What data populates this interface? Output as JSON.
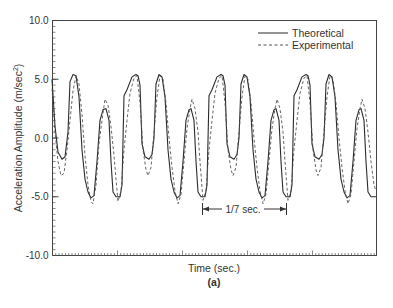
{
  "figure": {
    "panel_label": "(a)"
  },
  "chart_data": {
    "type": "line",
    "title": "",
    "xlabel": "Time (sec.)",
    "ylabel": "Acceleration Amplitude (m/sec²)",
    "ylabel_parts": {
      "main": "Acceleration Amplitude (m/sec",
      "sup": "2",
      "close": ")"
    },
    "ylim": [
      -10.0,
      10.0
    ],
    "yticks": [
      10.0,
      5.0,
      0.0,
      -5.0,
      -10.0
    ],
    "ytick_labels": [
      "10.0",
      "5.0",
      "0.0",
      "-5.0",
      "-10.0"
    ],
    "xticks_labeled": false,
    "grid": false,
    "legend_position": "upper right",
    "legend": [
      {
        "name": "Theoretical",
        "style": "solid"
      },
      {
        "name": "Experimental",
        "style": "dashed"
      }
    ],
    "annotations": [
      {
        "text": "1/7 sec.",
        "type": "period-bracket",
        "note": "span of one repeating period"
      }
    ],
    "x_units": "pixel-relative time (period = 1/7 sec ≈ 85 units)",
    "series": [
      {
        "name": "Theoretical",
        "style": "solid",
        "points": [
          [
            52,
            5.0
          ],
          [
            55,
            1.0
          ],
          [
            58,
            -1.2
          ],
          [
            62,
            -1.8
          ],
          [
            65,
            -1.6
          ],
          [
            68,
            0.5
          ],
          [
            70,
            4.8
          ],
          [
            73,
            5.4
          ],
          [
            76,
            5.3
          ],
          [
            79,
            3.5
          ],
          [
            82,
            -1.0
          ],
          [
            85,
            -3.5
          ],
          [
            88,
            -4.6
          ],
          [
            91,
            -5.1
          ],
          [
            94,
            -4.9
          ],
          [
            97,
            -2.0
          ],
          [
            100,
            1.5
          ],
          [
            103,
            2.4
          ],
          [
            106,
            2.5
          ],
          [
            109,
            1.5
          ],
          [
            111,
            -2.0
          ],
          [
            113,
            -4.6
          ],
          [
            116,
            -5.0
          ],
          [
            120,
            -5.0
          ],
          [
            122,
            -4.0
          ],
          [
            124,
            3.6
          ],
          [
            127,
            4.1
          ],
          [
            132,
            5.2
          ],
          [
            136,
            5.4
          ],
          [
            138,
            5.3
          ],
          [
            140,
            4.5
          ],
          [
            142,
            -0.5
          ],
          [
            145,
            -1.6
          ],
          [
            149,
            -1.8
          ],
          [
            152,
            -1.4
          ],
          [
            154,
            0.0
          ],
          [
            156,
            4.6
          ],
          [
            159,
            5.4
          ],
          [
            162,
            5.2
          ],
          [
            165,
            3.5
          ],
          [
            168,
            -1.0
          ],
          [
            171,
            -3.5
          ],
          [
            174,
            -4.6
          ],
          [
            177,
            -5.1
          ],
          [
            180,
            -4.9
          ],
          [
            183,
            -2.0
          ],
          [
            186,
            1.5
          ],
          [
            189,
            2.4
          ],
          [
            191,
            2.5
          ],
          [
            194,
            1.5
          ],
          [
            196,
            -2.0
          ],
          [
            198,
            -4.6
          ],
          [
            201,
            -5.0
          ],
          [
            205,
            -5.0
          ],
          [
            207,
            -4.0
          ],
          [
            209,
            3.6
          ],
          [
            212,
            4.1
          ],
          [
            217,
            5.2
          ],
          [
            221,
            5.4
          ],
          [
            223,
            5.3
          ],
          [
            225,
            4.5
          ],
          [
            227,
            -0.5
          ],
          [
            230,
            -1.6
          ],
          [
            234,
            -1.8
          ],
          [
            237,
            -1.4
          ],
          [
            239,
            0.0
          ],
          [
            241,
            4.6
          ],
          [
            244,
            5.4
          ],
          [
            247,
            5.2
          ],
          [
            250,
            3.5
          ],
          [
            253,
            -1.0
          ],
          [
            256,
            -3.5
          ],
          [
            259,
            -4.6
          ],
          [
            262,
            -5.1
          ],
          [
            265,
            -4.9
          ],
          [
            268,
            -2.0
          ],
          [
            271,
            1.5
          ],
          [
            274,
            2.4
          ],
          [
            276,
            2.5
          ],
          [
            279,
            1.5
          ],
          [
            281,
            -2.0
          ],
          [
            283,
            -4.6
          ],
          [
            286,
            -5.0
          ],
          [
            290,
            -5.0
          ],
          [
            292,
            -4.0
          ],
          [
            294,
            3.6
          ],
          [
            297,
            4.1
          ],
          [
            302,
            5.2
          ],
          [
            306,
            5.4
          ],
          [
            308,
            5.3
          ],
          [
            310,
            4.5
          ],
          [
            312,
            -0.5
          ],
          [
            315,
            -1.6
          ],
          [
            319,
            -1.8
          ],
          [
            322,
            -1.4
          ],
          [
            324,
            0.0
          ],
          [
            326,
            4.6
          ],
          [
            329,
            5.4
          ],
          [
            332,
            5.2
          ],
          [
            335,
            3.5
          ],
          [
            338,
            -1.0
          ],
          [
            341,
            -3.5
          ],
          [
            344,
            -4.6
          ],
          [
            347,
            -5.1
          ],
          [
            350,
            -4.9
          ],
          [
            353,
            -2.0
          ],
          [
            356,
            1.5
          ],
          [
            359,
            2.4
          ],
          [
            361,
            2.5
          ],
          [
            364,
            1.5
          ],
          [
            366,
            -2.0
          ],
          [
            368,
            -4.6
          ],
          [
            371,
            -5.0
          ],
          [
            376,
            -5.0
          ]
        ]
      },
      {
        "name": "Experimental",
        "style": "dashed",
        "points": [
          [
            52,
            4.2
          ],
          [
            55,
            0.5
          ],
          [
            58,
            -2.0
          ],
          [
            61,
            -3.2
          ],
          [
            64,
            -3.0
          ],
          [
            67,
            -1.0
          ],
          [
            70,
            1.5
          ],
          [
            73,
            4.0
          ],
          [
            76,
            5.3
          ],
          [
            79,
            4.6
          ],
          [
            82,
            2.0
          ],
          [
            85,
            -1.5
          ],
          [
            88,
            -4.0
          ],
          [
            91,
            -5.4
          ],
          [
            93,
            -5.6
          ],
          [
            96,
            -4.0
          ],
          [
            99,
            -0.5
          ],
          [
            102,
            1.5
          ],
          [
            105,
            3.3
          ],
          [
            108,
            2.8
          ],
          [
            111,
            1.0
          ],
          [
            114,
            -1.5
          ],
          [
            116,
            -3.5
          ],
          [
            118,
            -5.4
          ],
          [
            121,
            -4.5
          ],
          [
            124,
            -1.0
          ],
          [
            127,
            1.5
          ],
          [
            130,
            3.8
          ],
          [
            134,
            5.1
          ],
          [
            137,
            5.3
          ],
          [
            140,
            3.0
          ],
          [
            143,
            -1.0
          ],
          [
            146,
            -2.7
          ],
          [
            148,
            -3.2
          ],
          [
            151,
            -2.5
          ],
          [
            154,
            0.5
          ],
          [
            157,
            3.5
          ],
          [
            160,
            5.3
          ],
          [
            163,
            5.0
          ],
          [
            166,
            3.0
          ],
          [
            169,
            0.0
          ],
          [
            172,
            -2.5
          ],
          [
            175,
            -4.5
          ],
          [
            178,
            -5.6
          ],
          [
            181,
            -4.8
          ],
          [
            184,
            -2.0
          ],
          [
            187,
            0.8
          ],
          [
            190,
            2.5
          ],
          [
            192,
            3.3
          ],
          [
            195,
            2.5
          ],
          [
            198,
            0.5
          ],
          [
            200,
            -2.0
          ],
          [
            203,
            -5.3
          ],
          [
            206,
            -4.5
          ],
          [
            209,
            -1.0
          ],
          [
            212,
            1.5
          ],
          [
            215,
            3.8
          ],
          [
            219,
            5.1
          ],
          [
            222,
            5.3
          ],
          [
            225,
            3.0
          ],
          [
            228,
            -1.0
          ],
          [
            231,
            -2.7
          ],
          [
            233,
            -3.2
          ],
          [
            236,
            -2.5
          ],
          [
            239,
            0.5
          ],
          [
            242,
            3.5
          ],
          [
            245,
            5.3
          ],
          [
            248,
            5.0
          ],
          [
            251,
            3.0
          ],
          [
            254,
            0.0
          ],
          [
            257,
            -2.5
          ],
          [
            260,
            -4.5
          ],
          [
            263,
            -5.6
          ],
          [
            266,
            -4.8
          ],
          [
            269,
            -2.0
          ],
          [
            272,
            0.8
          ],
          [
            275,
            2.5
          ],
          [
            277,
            3.3
          ],
          [
            280,
            2.5
          ],
          [
            283,
            0.5
          ],
          [
            285,
            -2.0
          ],
          [
            288,
            -5.3
          ],
          [
            291,
            -4.5
          ],
          [
            294,
            -1.0
          ],
          [
            297,
            1.5
          ],
          [
            300,
            3.8
          ],
          [
            304,
            5.1
          ],
          [
            307,
            5.3
          ],
          [
            310,
            3.0
          ],
          [
            313,
            -1.0
          ],
          [
            316,
            -2.7
          ],
          [
            318,
            -3.2
          ],
          [
            321,
            -2.5
          ],
          [
            324,
            0.5
          ],
          [
            327,
            3.5
          ],
          [
            330,
            5.3
          ],
          [
            333,
            5.0
          ],
          [
            336,
            3.0
          ],
          [
            339,
            0.0
          ],
          [
            342,
            -2.5
          ],
          [
            345,
            -4.5
          ],
          [
            348,
            -5.6
          ],
          [
            351,
            -4.8
          ],
          [
            354,
            -2.0
          ],
          [
            357,
            0.8
          ],
          [
            360,
            2.5
          ],
          [
            362,
            3.3
          ],
          [
            365,
            2.5
          ],
          [
            368,
            0.5
          ],
          [
            371,
            -2.0
          ],
          [
            374,
            -4.0
          ],
          [
            376,
            -4.5
          ]
        ]
      }
    ]
  }
}
